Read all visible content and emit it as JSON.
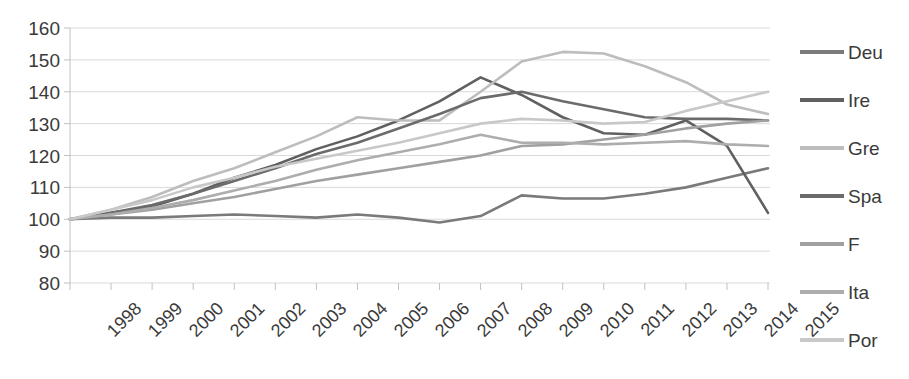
{
  "chart_data": {
    "type": "line",
    "title": "",
    "subtitle": "",
    "xlabel": "",
    "ylabel": "",
    "x": [
      1998,
      1999,
      2000,
      2001,
      2002,
      2003,
      2004,
      2005,
      2006,
      2007,
      2008,
      2009,
      2010,
      2011,
      2012,
      2013,
      2014,
      2015
    ],
    "categories": [
      "1998",
      "1999",
      "2000",
      "2001",
      "2002",
      "2003",
      "2004",
      "2005",
      "2006",
      "2007",
      "2008",
      "2009",
      "2010",
      "2011",
      "2012",
      "2013",
      "2014",
      "2015"
    ],
    "ylim": [
      80,
      160
    ],
    "yticks": [
      80,
      90,
      100,
      110,
      120,
      130,
      140,
      150,
      160
    ],
    "ytick_labels": [
      "80",
      "90",
      "100",
      "110",
      "120",
      "130",
      "140",
      "150",
      "160"
    ],
    "grid": true,
    "legend_position": "right",
    "series": [
      {
        "name": "Deu",
        "color": "#7a7a7a",
        "values": [
          100,
          100.5,
          100.5,
          101,
          101.5,
          101,
          100.5,
          101.5,
          100.5,
          99,
          101,
          107.5,
          106.5,
          106.5,
          108,
          110,
          113,
          116
        ]
      },
      {
        "name": "Ire",
        "color": "#606060",
        "values": [
          100,
          102,
          104,
          108,
          113,
          117,
          122,
          126,
          131,
          137,
          144.5,
          139,
          132,
          127,
          126.5,
          131,
          123,
          102
        ]
      },
      {
        "name": "Gre",
        "color": "#bdbdbd",
        "values": [
          100,
          103,
          107,
          112,
          116,
          121,
          126,
          132,
          131,
          131,
          140,
          149.5,
          152.5,
          152,
          148,
          143,
          136,
          133
        ]
      },
      {
        "name": "Spa",
        "color": "#6b6b6b",
        "values": [
          100,
          102,
          104.5,
          108,
          112,
          116,
          120.5,
          124,
          128.5,
          133,
          138,
          140,
          137,
          134.5,
          132,
          131.5,
          131.5,
          131
        ]
      },
      {
        "name": "F",
        "color": "#a0a0a0",
        "values": [
          100,
          101.5,
          103,
          105,
          107,
          109.5,
          112,
          114,
          116,
          118,
          120,
          123,
          123.5,
          125,
          126.5,
          128.5,
          130,
          131
        ]
      },
      {
        "name": "Ita",
        "color": "#adadad",
        "values": [
          100,
          101.5,
          103.5,
          106,
          109,
          112,
          115.5,
          118.5,
          121,
          123.5,
          126.5,
          124,
          124,
          123.5,
          124,
          124.5,
          123.5,
          123
        ]
      },
      {
        "name": "Por",
        "color": "#c8c8c8",
        "values": [
          100,
          103,
          106,
          110,
          113,
          116.5,
          119,
          121.5,
          124,
          127,
          130,
          131.5,
          131,
          130,
          130.5,
          134,
          137,
          140
        ]
      }
    ]
  },
  "legend": {
    "items": [
      {
        "label": "Deu",
        "color": "#7a7a7a"
      },
      {
        "label": "Ire",
        "color": "#606060"
      },
      {
        "label": "Gre",
        "color": "#bdbdbd"
      },
      {
        "label": "Spa",
        "color": "#6b6b6b"
      },
      {
        "label": "F",
        "color": "#a0a0a0"
      },
      {
        "label": "Ita",
        "color": "#adadad"
      },
      {
        "label": "Por",
        "color": "#c8c8c8"
      }
    ]
  },
  "axes": {
    "y_min": 80,
    "y_max": 160,
    "y_step": 10,
    "x_first": "1998",
    "x_last": "2015"
  },
  "colors": {
    "grid": "#d9d9d9",
    "axis": "#c0c0c0",
    "text": "#3a3a3a",
    "background": "#ffffff"
  }
}
